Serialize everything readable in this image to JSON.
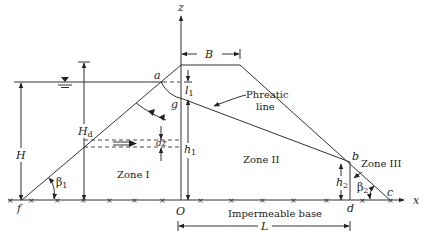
{
  "diagram": {
    "axes": {
      "x_label": "x",
      "z_label": "z",
      "origin_label": "O"
    },
    "points": {
      "a": "a",
      "b": "b",
      "c": "c",
      "d": "d",
      "f": "f",
      "g": "g"
    },
    "dimensions": {
      "B": "B",
      "H": "H",
      "Hd_main": "H",
      "Hd_sub": "d",
      "l1_main": "l",
      "l1_sub": "1",
      "h1_main": "h",
      "h1_sub": "1",
      "h2_main": "h",
      "h2_sub": "2",
      "dz": "dz",
      "L": "L"
    },
    "angles": {
      "beta1_main": "β",
      "beta1_sub": "1",
      "beta2_main": "β",
      "beta2_sub": "2"
    },
    "zones": [
      "Zone I",
      "Zone II",
      "Zone III"
    ],
    "labels": {
      "phreatic_line_1": "Phreatic",
      "phreatic_line_2": "line",
      "base": "Impermeable base"
    }
  }
}
